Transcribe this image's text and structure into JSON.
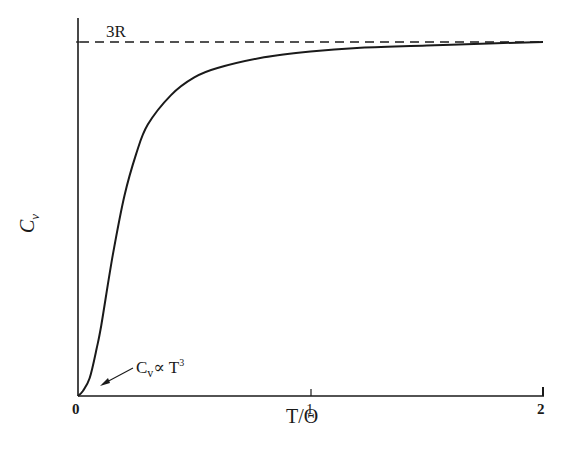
{
  "chart_data": {
    "type": "line",
    "title": "",
    "xlabel": "T/Θ",
    "ylabel": "Cv",
    "xlim": [
      0,
      2
    ],
    "ylim": [
      0,
      3
    ],
    "x_ticks": [
      "0",
      "1",
      "2"
    ],
    "grid": false,
    "legend": null,
    "series": [
      {
        "name": "Cv (Debye heat capacity)",
        "style": "solid",
        "x": [
          0.0,
          0.02,
          0.05,
          0.08,
          0.1,
          0.15,
          0.2,
          0.25,
          0.3,
          0.4,
          0.5,
          0.6,
          0.8,
          1.0,
          1.2,
          1.5,
          1.8,
          2.0
        ],
        "y": [
          0.0,
          0.04,
          0.15,
          0.4,
          0.6,
          1.2,
          1.7,
          2.05,
          2.3,
          2.55,
          2.7,
          2.78,
          2.87,
          2.92,
          2.95,
          2.97,
          2.99,
          3.0
        ]
      },
      {
        "name": "3R asymptote",
        "style": "dashed",
        "x": [
          0,
          2
        ],
        "y": [
          3,
          3
        ]
      }
    ],
    "annotations": [
      {
        "text": "3R",
        "x": 0.15,
        "y": 3.0
      },
      {
        "text": "Cv ∝ T³",
        "x": 0.06,
        "y": 0.2,
        "arrow": true
      }
    ]
  },
  "labels": {
    "y_axis": {
      "main": "C",
      "sub": "v"
    },
    "x_axis": "T/Θ",
    "hline": "3R",
    "annotation": {
      "c": "C",
      "sub": "v",
      "prop": "∝",
      "t": "T",
      "exp": "3"
    },
    "ticks": {
      "t0": "0",
      "t1": "1",
      "t2": "2"
    }
  },
  "colors": {
    "ink": "#1a1a1a",
    "background": "#ffffff"
  }
}
